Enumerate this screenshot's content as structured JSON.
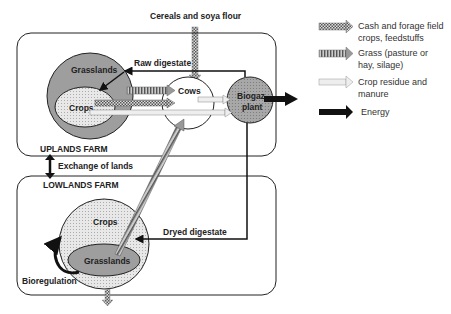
{
  "diagram": {
    "top_input_label": "Cereals and soya flour",
    "uplands": {
      "farm_label": "UPLANDS FARM",
      "grasslands_label": "Grasslands",
      "crops_label": "Crops",
      "cows_label": "Cows",
      "biogas_label_line1": "Biogaz",
      "biogas_label_line2": "plant",
      "raw_digestate_label": "Raw digestate"
    },
    "exchange_label": "Exchange of lands",
    "lowlands": {
      "farm_label": "LOWLANDS FARM",
      "crops_label": "Crops",
      "grasslands_label": "Grasslands",
      "dryed_digestate_label": "Dryed digestate",
      "bioregulation_label": "Bioregulation"
    },
    "legend": [
      {
        "style": "checkered",
        "line1": "Cash and forage field",
        "line2": "crops, feedstuffs"
      },
      {
        "style": "striped",
        "line1": "Grass (pasture or",
        "line2": "hay, silage)"
      },
      {
        "style": "light",
        "line1": "Crop residue and",
        "line2": "manure"
      },
      {
        "style": "solid",
        "line1": "Energy",
        "line2": ""
      }
    ],
    "colors": {
      "grassland_fill": "#9e9e9e",
      "crops_fill": "#e6e6e6",
      "biogas_fill": "#a8a8a8",
      "cows_fill": "#ffffff",
      "line": "#111111"
    }
  }
}
